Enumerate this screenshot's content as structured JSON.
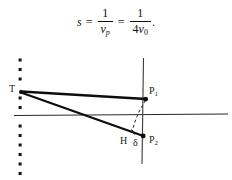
{
  "figure": {
    "background_color": "#ffffff",
    "ink_color": "#111111",
    "formula": {
      "lhs": "s",
      "equals_1": "=",
      "frac1_num": "1",
      "frac1_den_var": "v",
      "frac1_den_sub": "p",
      "equals_2": "=",
      "frac2_num": "1",
      "frac2_den_coeff": "4",
      "frac2_den_var": "v",
      "frac2_den_sub": "0",
      "terminator": "."
    },
    "labels": {
      "source": "T",
      "point_1_base": "P",
      "point_1_sub": "1",
      "point_2_base": "P",
      "point_2_sub": "2",
      "foot": "H",
      "delta": "δ"
    },
    "geometry": {
      "dotted_line_x": 20,
      "dotted_line_dot_count": 11,
      "horizontal_axis_y": 115,
      "horizontal_axis_x_start": 14,
      "horizontal_axis_x_end": 228,
      "vertical_axis_x": 143,
      "vertical_axis_y_start": 58,
      "vertical_axis_y_end": 164,
      "source_point": [
        21,
        92
      ],
      "point_1": [
        146,
        99
      ],
      "point_2": [
        143,
        136
      ],
      "foot_point": [
        133,
        132
      ],
      "arc_style": "dashed"
    }
  }
}
